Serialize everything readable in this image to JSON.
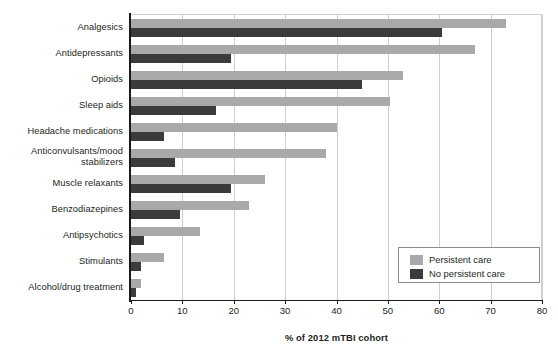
{
  "chart_data": {
    "type": "bar",
    "orientation": "horizontal",
    "title": "",
    "xlabel": "% of 2012 mTBI cohort",
    "ylabel": "",
    "xlim": [
      0,
      80
    ],
    "xticks": [
      0,
      10,
      20,
      30,
      40,
      50,
      60,
      70,
      80
    ],
    "grid": "vertical",
    "legend_position": "bottom-right",
    "categories": [
      "Analgesics",
      "Antidepressants",
      "Opioids",
      "Sleep aids",
      "Headache medications",
      "Anticonvulsants/mood stabilizers",
      "Muscle relaxants",
      "Benzodiazepines",
      "Antipsychotics",
      "Stimulants",
      "Alcohol/drug treatment"
    ],
    "series": [
      {
        "name": "Persistent care",
        "color": "#a9a9a9",
        "values": [
          73,
          67,
          53,
          50.5,
          40,
          38,
          26,
          23,
          13.5,
          6.5,
          2
        ]
      },
      {
        "name": "No persistent care",
        "color": "#3b3b3b",
        "values": [
          60.5,
          19.5,
          45,
          16.5,
          6.5,
          8.5,
          19.5,
          9.5,
          2.5,
          2,
          1
        ]
      }
    ]
  },
  "legend": {
    "items": [
      {
        "label": "Persistent care",
        "swatch": "light"
      },
      {
        "label": "No persistent care",
        "swatch": "dark"
      }
    ]
  }
}
